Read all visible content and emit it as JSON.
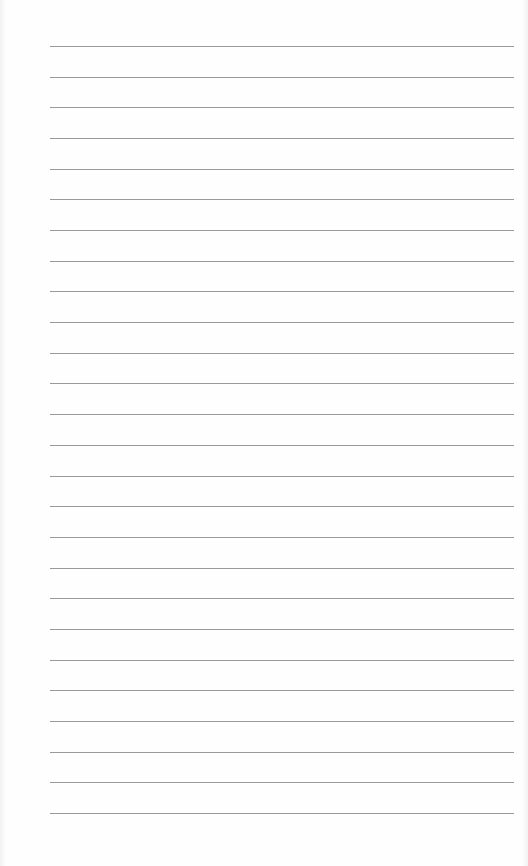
{
  "page": {
    "type": "lined-paper",
    "background_color": "#fefefe",
    "rule_color": "#9a9a9a",
    "rule_count": 26,
    "rule_left": 50,
    "rule_width": 464,
    "first_rule_y": 46,
    "rule_spacing": 30.68
  }
}
